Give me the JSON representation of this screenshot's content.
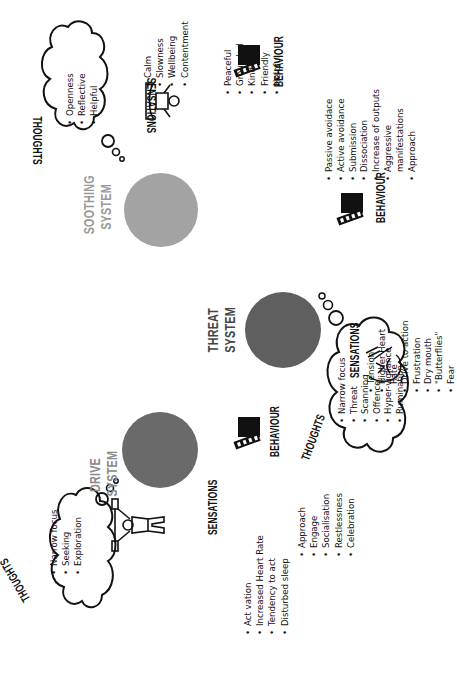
{
  "diagram": {
    "orientation": "rotated 90 degrees counter-clockwise",
    "colors": {
      "soothing": "#a3a3a3",
      "threat": "#5f5f5f",
      "drive": "#6a6a6a",
      "soothing_label": "#9a9a9a",
      "threat_label": "#444444",
      "drive_label": "#8a8a8a",
      "ink": "#111111"
    }
  },
  "soothing": {
    "label_line1": "SOOTHING",
    "label_line2": "SYSTEM",
    "thoughts": {
      "heading": "THOUGHTS",
      "items": [
        "Openness",
        "Reflective",
        "Helpful"
      ]
    },
    "sensations": {
      "heading": "SENSATIONS",
      "icon": "meditating-person-icon",
      "items": [
        "Calm",
        "Slowness",
        "Wellbeing",
        "Contentment"
      ]
    },
    "behaviour": {
      "heading": "BEHAVIOUR",
      "icon": "clapperboard-icon",
      "items": [
        "Peaceful",
        "Grounded",
        "Kind",
        "Friendly",
        "Helpful"
      ]
    }
  },
  "threat": {
    "label_line1": "THREAT",
    "label_line2": "SYSTEM",
    "sensations": {
      "heading": "SENSATIONS",
      "icon": "anxious-face-icon",
      "items": [
        "Tension",
        "Higher Heart",
        "Rate",
        "Drive to action",
        "Frustration",
        "Dry mouth",
        "\"Butterflies\"",
        "Fear"
      ]
    },
    "behaviour": {
      "heading": "BEHAVIOUR",
      "icon": "clapperboard-icon",
      "items": [
        "Passive avoidace",
        "Active avoidance",
        "Submission",
        "Dissociation",
        "Increase of outputs",
        "Aggressive",
        "manifestations",
        "Approach"
      ]
    },
    "thoughts": {
      "heading": "THOUGHTS",
      "items": [
        "Narrow focus",
        "Threat",
        "Scanning",
        "Offence",
        "Hyper-vigilance",
        "Rumination"
      ]
    }
  },
  "drive": {
    "label_line1": "DRIVE",
    "label_line2": "SYSTEM",
    "thoughts": {
      "heading": "THOUGHTS",
      "items": [
        "Narrow focus",
        "Seeking",
        "Exploration"
      ]
    },
    "sensations": {
      "heading": "SENSATIONS",
      "icon": "weightlifter-icon",
      "items": [
        "Act vation",
        "Increased Heart Rate",
        "Tendency to act",
        "Disturbed sleep"
      ]
    },
    "behaviour": {
      "heading": "BEHAVIOUR",
      "icon": "clapperboard-icon",
      "items": [
        "Approach",
        "Engage",
        "Socialisation",
        "Restlessness",
        "Celebration"
      ]
    }
  }
}
